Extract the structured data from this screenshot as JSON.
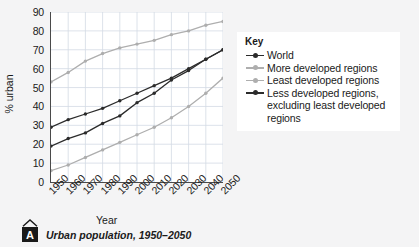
{
  "figure": {
    "caption_badge": "A",
    "caption_text": "Urban population, 1950–2050"
  },
  "legend": {
    "title": "Key",
    "entries": [
      {
        "label": "World",
        "color": "#2b2b2b",
        "marker": "filled"
      },
      {
        "label": "More developed regions",
        "color": "#aeaeae",
        "marker": "filled"
      },
      {
        "label": "Least developed regions",
        "color": "#aeaeae",
        "marker": "filled"
      },
      {
        "label": "Less developed regions,",
        "color": "#2b2b2b",
        "marker": "filled"
      }
    ],
    "continuation": [
      "excluding least developed",
      "regions"
    ]
  },
  "chart_data": {
    "type": "line",
    "title": "Urban population, 1950–2050",
    "xlabel": "Year",
    "ylabel": "% urban",
    "x": [
      1950,
      1960,
      1970,
      1980,
      1990,
      2000,
      2010,
      2020,
      2030,
      2040,
      2050
    ],
    "categories": [
      "1950",
      "1960",
      "1970",
      "1980",
      "1990",
      "2000",
      "2010",
      "2020",
      "2030",
      "2040",
      "2050"
    ],
    "xlim": [
      1950,
      2050
    ],
    "ylim": [
      0,
      90
    ],
    "yticks": [
      0,
      10,
      20,
      30,
      40,
      50,
      60,
      70,
      80,
      90
    ],
    "grid": true,
    "legend_position": "right",
    "series": [
      {
        "name": "World",
        "color": "#2b2b2b",
        "values": [
          29,
          33,
          36,
          39,
          43,
          47,
          51,
          55,
          60,
          65,
          70
        ]
      },
      {
        "name": "More developed regions",
        "color": "#aeaeae",
        "values": [
          53,
          58,
          64,
          68,
          71,
          73,
          75,
          78,
          80,
          83,
          85
        ]
      },
      {
        "name": "Least developed regions",
        "color": "#aeaeae",
        "values": [
          6,
          9,
          13,
          17,
          21,
          25,
          29,
          34,
          40,
          47,
          55
        ]
      },
      {
        "name": "Less developed regions, excluding least developed regions",
        "color": "#2b2b2b",
        "values": [
          19,
          23,
          26,
          31,
          35,
          42,
          47,
          54,
          59,
          65,
          70
        ]
      }
    ]
  },
  "colors": {
    "background": "#f4f4f5",
    "plot_background": "#ffffff",
    "gridline": "#d3dbe4",
    "axis": "#4a4a4a",
    "dark_series": "#2b2b2b",
    "light_series": "#aeaeae"
  }
}
